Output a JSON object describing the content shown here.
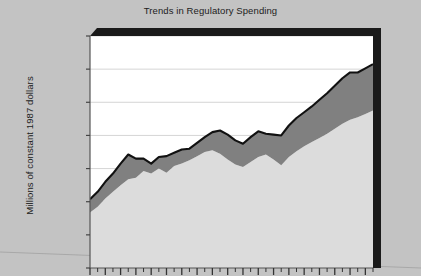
{
  "chart_data": {
    "type": "area",
    "title": "Trends in Regulatory Spending",
    "xlabel": "",
    "ylabel": "Millions of constant 1987 dollars",
    "ylim": [
      0,
      14000
    ],
    "ytick_values": [
      0,
      2000,
      4000,
      6000,
      8000,
      10000,
      12000,
      14000
    ],
    "ytick_labels": [
      "0",
      "2,000",
      "4,000",
      "6,000",
      "8,000",
      "10,000",
      "12,000",
      "14,000"
    ],
    "grid": true,
    "legend_position": "none",
    "stacked": true,
    "x_axis_note": "tick marks only; x tick labels are cropped below the visible area",
    "x_tick_count": 38,
    "x_major_tick_count": 19,
    "x": [
      1,
      2,
      3,
      4,
      5,
      6,
      7,
      8,
      9,
      10,
      11,
      12,
      13,
      14,
      15,
      16,
      17,
      18,
      19,
      20,
      21,
      22,
      23,
      24,
      25,
      26,
      27,
      28,
      29,
      30,
      31,
      32,
      33,
      34,
      35,
      36,
      37,
      38
    ],
    "series": [
      {
        "name": "Lower band",
        "color": "#dcdcdc",
        "values": [
          3350,
          3700,
          4200,
          4600,
          5000,
          5350,
          5450,
          5850,
          5700,
          6000,
          5750,
          6150,
          6300,
          6500,
          6750,
          7000,
          7100,
          6900,
          6550,
          6250,
          6100,
          6400,
          6700,
          6850,
          6550,
          6200,
          6700,
          7050,
          7350,
          7600,
          7850,
          8100,
          8400,
          8700,
          8950,
          9100,
          9300,
          9500
        ]
      },
      {
        "name": "Upper band",
        "color": "#808080",
        "values": [
          800,
          900,
          1000,
          1100,
          1300,
          1500,
          1150,
          750,
          600,
          700,
          1000,
          800,
          850,
          700,
          800,
          900,
          1100,
          1400,
          1500,
          1450,
          1400,
          1500,
          1550,
          1250,
          1500,
          1800,
          1900,
          2000,
          2050,
          2150,
          2300,
          2450,
          2600,
          2750,
          2850,
          2700,
          2750,
          2800
        ]
      }
    ],
    "total_values": [
      4150,
      4600,
      5200,
      5700,
      6300,
      6850,
      6600,
      6600,
      6300,
      6700,
      6750,
      6950,
      7150,
      7200,
      7550,
      7900,
      8200,
      8300,
      8050,
      7700,
      7500,
      7900,
      8250,
      8100,
      8050,
      8000,
      8600,
      9050,
      9400,
      9750,
      10150,
      10550,
      11000,
      11450,
      11800,
      11800,
      12050,
      12300
    ],
    "colors": {
      "page_background": "#c3c3c3",
      "plot_background": "#ffffff",
      "gridline": "#d0d0d0",
      "frame_shadow": "#1a1a1a",
      "axis_line": "#555555",
      "text": "#1c1c1c"
    }
  }
}
